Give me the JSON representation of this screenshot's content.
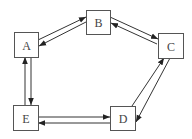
{
  "diagram": {
    "type": "directed-graph",
    "colors": {
      "stroke": "#555555",
      "edge": "#333333",
      "arrowhead": "#222222",
      "text": "#444444",
      "background": "#ffffff"
    },
    "nodes": [
      {
        "id": "A",
        "label": "A",
        "x": 14,
        "y": 32,
        "w": 24,
        "h": 25
      },
      {
        "id": "B",
        "label": "B",
        "x": 86,
        "y": 10,
        "w": 24,
        "h": 24
      },
      {
        "id": "C",
        "label": "C",
        "x": 158,
        "y": 33,
        "w": 25,
        "h": 25
      },
      {
        "id": "D",
        "label": "D",
        "x": 110,
        "y": 106,
        "w": 25,
        "h": 24
      },
      {
        "id": "E",
        "label": "E",
        "x": 13,
        "y": 105,
        "w": 25,
        "h": 25
      }
    ],
    "edges": [
      {
        "from": "A",
        "to": "B",
        "x1": 38,
        "y1": 40,
        "x2": 86,
        "y2": 17
      },
      {
        "from": "B",
        "to": "A",
        "x1": 86,
        "y1": 22,
        "x2": 39,
        "y2": 46
      },
      {
        "from": "B",
        "to": "C",
        "x1": 110,
        "y1": 17,
        "x2": 158,
        "y2": 39
      },
      {
        "from": "C",
        "to": "B",
        "x1": 157,
        "y1": 44,
        "x2": 111,
        "y2": 23
      },
      {
        "from": "C",
        "to": "D",
        "x1": 170,
        "y1": 58,
        "x2": 136,
        "y2": 122
      },
      {
        "from": "D",
        "to": "C",
        "x1": 132,
        "y1": 106,
        "x2": 164,
        "y2": 58
      },
      {
        "from": "A",
        "to": "E",
        "x1": 31,
        "y1": 57,
        "x2": 31,
        "y2": 105
      },
      {
        "from": "E",
        "to": "A",
        "x1": 25,
        "y1": 105,
        "x2": 25,
        "y2": 57
      },
      {
        "from": "E",
        "to": "D",
        "x1": 38,
        "y1": 117,
        "x2": 110,
        "y2": 117
      },
      {
        "from": "D",
        "to": "E",
        "x1": 110,
        "y1": 123,
        "x2": 38,
        "y2": 123
      }
    ]
  }
}
